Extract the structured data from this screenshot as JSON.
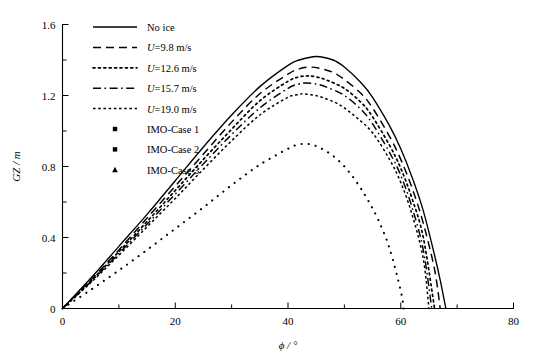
{
  "chart_data": {
    "type": "line",
    "title": "",
    "xlabel": "ϕ / °",
    "ylabel": "GZ / m",
    "xlim": [
      0,
      80
    ],
    "ylim": [
      0,
      1.6
    ],
    "xticks": [
      "0",
      "20",
      "40",
      "60",
      "80"
    ],
    "xtick_values": [
      0,
      20,
      40,
      60,
      80
    ],
    "xminor_step": 10,
    "yticks": [
      "0",
      "0.4",
      "0.8",
      "1.2",
      "1.6"
    ],
    "ytick_values": [
      0,
      0.4,
      0.8,
      1.2,
      1.6
    ],
    "yminor_step": 0.2,
    "grid": false,
    "legend_position": "upper-left-inside",
    "series": [
      {
        "name": "No ice",
        "style": "solid",
        "x": [
          0,
          5,
          10,
          15,
          20,
          25,
          30,
          35,
          40,
          42,
          45,
          48,
          50,
          53,
          55,
          58,
          60,
          62,
          64,
          66,
          67,
          68
        ],
        "y": [
          0,
          0.17,
          0.35,
          0.53,
          0.72,
          0.91,
          1.09,
          1.25,
          1.37,
          1.4,
          1.42,
          1.4,
          1.36,
          1.27,
          1.19,
          1.03,
          0.9,
          0.74,
          0.55,
          0.3,
          0.16,
          0.0
        ]
      },
      {
        "name": "U=9.8 m/s",
        "style": "dashed",
        "x": [
          0,
          5,
          10,
          15,
          20,
          25,
          30,
          35,
          40,
          42,
          44,
          46,
          48,
          50,
          53,
          55,
          58,
          60,
          62,
          64,
          66,
          67
        ],
        "y": [
          0,
          0.16,
          0.33,
          0.51,
          0.69,
          0.87,
          1.05,
          1.21,
          1.32,
          1.35,
          1.36,
          1.35,
          1.33,
          1.29,
          1.21,
          1.13,
          0.97,
          0.84,
          0.68,
          0.48,
          0.22,
          0.0
        ]
      },
      {
        "name": "U=12.6 m/s",
        "style": "dotted",
        "x": [
          0,
          5,
          10,
          15,
          20,
          25,
          30,
          35,
          40,
          42,
          43.5,
          45,
          47,
          50,
          53,
          55,
          58,
          60,
          62,
          64,
          66
        ],
        "y": [
          0,
          0.155,
          0.32,
          0.49,
          0.665,
          0.84,
          1.01,
          1.17,
          1.28,
          1.305,
          1.31,
          1.305,
          1.285,
          1.24,
          1.16,
          1.08,
          0.92,
          0.79,
          0.62,
          0.4,
          0.0
        ]
      },
      {
        "name": "U=15.7 m/s",
        "style": "dash-dot",
        "x": [
          0,
          5,
          10,
          15,
          20,
          25,
          30,
          35,
          40,
          42,
          43,
          45,
          47,
          50,
          53,
          55,
          58,
          60,
          62,
          64,
          65.5
        ],
        "y": [
          0,
          0.15,
          0.31,
          0.475,
          0.645,
          0.815,
          0.98,
          1.13,
          1.24,
          1.265,
          1.27,
          1.265,
          1.245,
          1.2,
          1.12,
          1.04,
          0.88,
          0.75,
          0.57,
          0.33,
          0.0
        ]
      },
      {
        "name": "U=19.0 m/s",
        "style": "fine-dotted",
        "x": [
          0,
          5,
          10,
          15,
          20,
          25,
          30,
          35,
          40,
          42,
          42.5,
          44,
          46,
          49,
          52,
          55,
          58,
          60,
          62,
          64,
          65
        ],
        "y": [
          0,
          0.145,
          0.3,
          0.46,
          0.62,
          0.785,
          0.945,
          1.09,
          1.19,
          1.205,
          1.21,
          1.205,
          1.19,
          1.15,
          1.08,
          0.99,
          0.84,
          0.71,
          0.53,
          0.28,
          0.0
        ]
      },
      {
        "name": "IMO-Case 3 curve",
        "style": "sparse-dotted",
        "x": [
          0,
          5,
          10,
          15,
          20,
          25,
          30,
          35,
          40,
          42,
          44,
          46,
          48,
          50,
          52,
          54,
          56,
          58,
          60,
          60.5
        ],
        "y": [
          0,
          0.105,
          0.215,
          0.33,
          0.45,
          0.57,
          0.695,
          0.81,
          0.9,
          0.925,
          0.925,
          0.9,
          0.86,
          0.8,
          0.72,
          0.62,
          0.5,
          0.34,
          0.1,
          0.0
        ]
      }
    ],
    "legend": [
      {
        "label": "No ice",
        "style": "solid",
        "kind": "line"
      },
      {
        "label": "U=9.8 m/s",
        "style": "dashed",
        "kind": "line",
        "italic_prefix": "U"
      },
      {
        "label": "U=12.6 m/s",
        "style": "dotted",
        "kind": "line",
        "italic_prefix": "U"
      },
      {
        "label": "U=15.7 m/s",
        "style": "dash-dot",
        "kind": "line",
        "italic_prefix": "U"
      },
      {
        "label": "U=19.0 m/s",
        "style": "fine-dotted",
        "kind": "line",
        "italic_prefix": "U"
      },
      {
        "label": "IMO-Case 1",
        "style": "marker-square",
        "kind": "marker"
      },
      {
        "label": "IMO-Case 2",
        "style": "marker-square",
        "kind": "marker"
      },
      {
        "label": "IMO-Case 3",
        "style": "marker-triangle",
        "kind": "marker"
      }
    ]
  }
}
